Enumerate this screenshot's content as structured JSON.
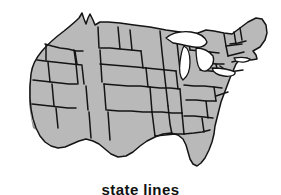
{
  "figure": {
    "caption": "state lines",
    "alt_title": "Outline map of the contiguous United States with state lines"
  },
  "colors": {
    "background": "#ffffff",
    "land_fill": "#b9b9b9",
    "border_stroke": "#141414",
    "lake_fill": "#ffffff",
    "shadow": "#8e8e8e",
    "caption_text": "#111111"
  },
  "map": {
    "region_name": "Contiguous United States",
    "feature_type": "state-lines",
    "lakes_visible": true,
    "lake_names": [
      "Lake Superior",
      "Lake Michigan",
      "Lake Huron",
      "Lake Erie",
      "Lake Ontario"
    ],
    "outline_paths": {
      "mainland": "M 31 74 L 33 62 L 38 55 L 44 47 L 52 40 L 60 34 L 68 28 L 74 23 L 79 18 L 82 14 L 84 18 L 86 23 L 88 19 L 90 15 L 93 19 L 95 24 L 99 22 L 104 22 L 112 23 L 122 24 L 134 25 L 148 27 L 162 29 L 176 32 L 188 34 L 196 36 L 200 32 L 205 30 L 212 31 L 220 33 L 228 34 L 234 31 L 240 27 L 246 23 L 252 20 L 257 18 L 262 19 L 265 24 L 267 31 L 266 38 L 263 44 L 259 48 L 254 50 L 250 52 L 253 55 L 256 58 L 252 60 L 247 60 L 243 58 L 239 60 L 236 64 L 234 69 L 231 74 L 228 79 L 226 85 L 224 91 L 222 97 L 220 103 L 218 109 L 216 115 L 215 121 L 214 127 L 213 133 L 212 139 L 211 145 L 209 151 L 206 157 L 202 162 L 197 165 L 192 165 L 188 162 L 185 157 L 183 151 L 182 145 L 180 140 L 177 136 L 172 134 L 166 134 L 160 135 L 154 137 L 148 140 L 142 144 L 137 149 L 132 153 L 127 156 L 121 157 L 115 156 L 110 153 L 106 149 L 102 145 L 98 142 L 93 140 L 88 139 L 83 140 L 78 142 L 73 144 L 68 146 L 63 147 L 57 147 L 52 145 L 47 142 L 43 138 L 39 133 L 36 127 L 34 120 L 32 113 L 31 105 L 30 97 L 30 89 L 30 81 Z",
      "florida": "M 197 140 L 200 147 L 202 154 L 203 160 L 201 164 L 197 165 L 194 163 L 192 158 L 191 151 L 192 144 Z",
      "maine": "M 246 23 L 252 20 L 257 18 L 262 19 L 265 24 L 267 31 L 266 38 L 262 42 L 257 43 L 252 41 L 248 37 L 245 31 Z"
    },
    "state_line_paths": [
      "M 47 44 L 52 46 L 58 48 L 64 49 L 70 50 L 76 51 L 82 51",
      "M 38 60 L 44 61 L 52 62 L 60 63 L 68 64 L 76 65 L 84 66",
      "M 34 80 L 42 81 L 50 82 L 58 83 L 66 84 L 74 84",
      "M 32 104 L 40 105 L 48 106 L 56 107 L 64 108 L 72 108",
      "M 46 48 L 46 60",
      "M 48 62 L 49 82",
      "M 52 84 L 53 106",
      "M 56 108 L 58 130",
      "M 76 51 L 78 64",
      "M 82 66 L 84 84",
      "M 86 86 L 88 110",
      "M 89 112 L 90 138",
      "M 98 26 L 99 48 L 100 64",
      "M 100 64 L 102 82",
      "M 104 84 L 106 110",
      "M 108 112 L 110 140",
      "M 74 50 L 76 64 L 78 84",
      "M 102 48 L 110 48 L 120 49 L 130 50 L 140 51",
      "M 100 64 L 112 65 L 124 66 L 136 67 L 146 68",
      "M 104 84 L 116 85 L 128 86 L 140 86 L 150 87",
      "M 106 110 L 118 111 L 130 111 L 142 112 L 152 112",
      "M 130 30 L 132 50",
      "M 140 51 L 142 68",
      "M 146 68 L 148 87",
      "M 150 87 L 152 112",
      "M 152 112 L 154 136",
      "M 118 26 L 120 49",
      "M 160 30 L 162 52 L 164 70",
      "M 164 70 L 166 88 L 168 106",
      "M 168 106 L 170 124 L 172 134",
      "M 146 68 L 156 69 L 166 70 L 176 71",
      "M 150 87 L 160 88 L 170 88 L 180 89",
      "M 152 112 L 162 112 L 172 113 L 182 113",
      "M 154 136 L 164 135 L 174 134 L 184 134",
      "M 176 71 L 178 89",
      "M 180 89 L 182 113",
      "M 182 113 L 184 134",
      "M 176 32 L 178 52 L 180 70",
      "M 188 34 L 190 50",
      "M 196 36 L 198 50 L 200 62",
      "M 190 50 L 200 51 L 210 52 L 220 53",
      "M 200 62 L 208 63 L 216 64 L 224 64",
      "M 200 70 L 210 71 L 218 72 L 226 72",
      "M 184 85 L 194 86 L 204 86 L 214 87 L 222 88",
      "M 186 100 L 196 100 L 206 101 L 216 101",
      "M 184 116 L 194 116 L 204 117 L 212 118",
      "M 184 134 L 194 133 L 202 132 L 210 130",
      "M 210 52 L 212 64",
      "M 216 64 L 218 74",
      "M 214 87 L 216 101",
      "M 206 101 L 208 118",
      "M 202 118 L 204 132",
      "M 224 33 L 226 46 L 228 56",
      "M 234 31 L 236 44",
      "M 240 27 L 242 40",
      "M 228 56 L 236 54 L 244 52",
      "M 230 44 L 238 43 L 246 41",
      "M 226 46 L 234 45 L 242 44",
      "M 232 62 L 240 60 L 248 58",
      "M 228 72 L 236 71 L 244 70"
    ],
    "lake_paths": [
      "M 166 38 L 172 34 L 180 32 L 190 32 L 198 34 L 204 38 L 206 43 L 202 46 L 196 47 L 190 46 L 184 44 L 178 43 L 172 42 Z",
      "M 184 46 L 188 48 L 190 54 L 190 62 L 188 70 L 186 76 L 183 79 L 180 76 L 179 70 L 180 62 L 181 54 Z",
      "M 196 48 L 202 48 L 208 50 L 212 54 L 214 60 L 212 66 L 208 70 L 203 71 L 199 68 L 197 62 L 196 55 Z",
      "M 212 68 L 220 68 L 228 69 L 234 71 L 236 74 L 232 76 L 225 76 L 218 74 L 213 72 Z",
      "M 234 58 L 240 57 L 246 57 L 250 59 L 248 62 L 242 62 L 236 61 Z"
    ],
    "shadow_paths": [
      "M 31 74 L 30 89 L 30 105 L 32 120 L 36 130 L 33 128 L 31 118 L 29 104 L 29 88 Z",
      "M 192 165 L 197 165 L 202 162 L 200 164 L 196 166 Z"
    ]
  }
}
